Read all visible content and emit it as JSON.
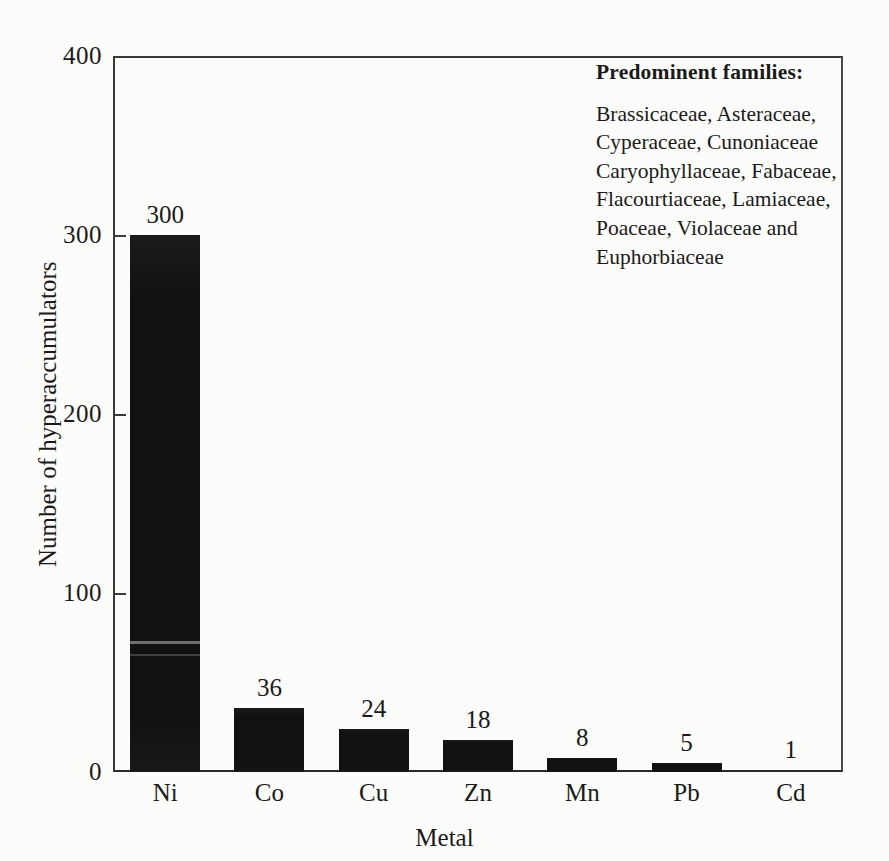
{
  "chart_data": {
    "type": "bar",
    "title": "",
    "xlabel": "Metal",
    "ylabel": "Number of hyperaccumulators",
    "categories": [
      "Ni",
      "Co",
      "Cu",
      "Zn",
      "Mn",
      "Pb",
      "Cd"
    ],
    "values": [
      300,
      36,
      24,
      18,
      8,
      5,
      1
    ],
    "value_labels": [
      "300",
      "36",
      "24",
      "18",
      "8",
      "5",
      "1"
    ],
    "ylim": [
      0,
      400
    ],
    "yticks": [
      0,
      100,
      200,
      300,
      400
    ],
    "ytick_labels": [
      "0",
      "100",
      "200",
      "300",
      "400"
    ],
    "grid": false,
    "legend_position": "top-right-inside",
    "bar_color": "#111111",
    "annotation": {
      "title": "Predominent families:",
      "lines": [
        "Brassicaceae, Asteraceae,",
        "Cyperaceae, Cunoniaceae",
        "Caryophyllaceae, Fabaceae,",
        "Flacourtiaceae, Lamiaceae,",
        "Poaceae, Violaceae and",
        "Euphorbiaceae"
      ]
    }
  }
}
